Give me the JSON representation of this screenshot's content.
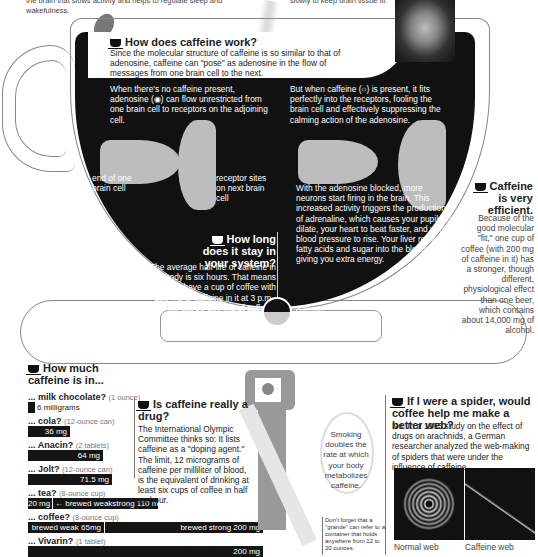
{
  "top_fragments": {
    "left": "the brain that slows activity and helps to regulate sleep and wakefulness.",
    "right": "slowly to keep brain tissue fit"
  },
  "how_works": {
    "title": "How does caffeine work?",
    "intro": "Since the molecular structure of caffeine is so similar to that of adenosine, caffeine can \"pose\" as adenosine in the flow of messages from one brain cell to the next.",
    "left_text": "When there's no caffeine present, adenosine (◉) can flow unrestricted from one brain cell to receptors on the adjoining cell.",
    "right_text": "But when caffeine (○) is present, it fits perfectly into the receptors, fooling the brain cell and effectively suppressing the calming action of the adenosine.",
    "label_end_cell": "end of one brain cell",
    "label_receptor": "receptor sites on next brain cell",
    "blocked_text": "With the adenosine blocked, more neurons start firing in the brain. This increased activity triggers the production of adrenaline, which causes your pupils to dilate, your heart to beat faster, and your blood pressure to rise. Your liver releases fatty acids and sugar into the bloodstream, giving you extra energy."
  },
  "stay": {
    "title": "How long does it stay in your system?",
    "text": "The average half-life of caffeine in your body is six hours. That means that if you have a cup of coffee with 200 mg of caffeine in it at 3 p.m., there will still be 100 mg of caffeine left in your body at 9 p.m.",
    "gauge_left": "100 mg",
    "gauge_right": "200 mg"
  },
  "efficient": {
    "title": "Caffeine is very efficient.",
    "text": "Because of the good molecular \"fit,\" one cup of coffee (with 200 mg of caffeine in it) has a stronger, though different, physiological effect than one beer, which contains about 14,000 mg of alcohol."
  },
  "how_much": {
    "title": "How much caffeine is in...",
    "items": [
      {
        "name": "... milk chocolate?",
        "unit": "(1 ounce)",
        "bar": "6 milligrams",
        "value": 6
      },
      {
        "name": "... cola?",
        "unit": "(12-ounce can)",
        "bar": "36 mg",
        "value": 36
      },
      {
        "name": "... Anacin?",
        "unit": "(2 tablets)",
        "bar": "64 mg",
        "value": 64
      },
      {
        "name": "... Jolt?",
        "unit": "(12-ounce can)",
        "bar": "71.5 mg",
        "value": 71.5
      },
      {
        "name": "... tea?",
        "unit": "(8-ounce cup)",
        "bar_weak": "20 mg",
        "bar_mid": "← brewed weak",
        "bar_strong": "strong 110 mg",
        "value_low": 20,
        "value_high": 110
      },
      {
        "name": "... coffee?",
        "unit": "(8-ounce cup)",
        "bar_weak": "brewed weak 65mg",
        "bar_strong": "brewed strong 200 mg",
        "value_low": 65,
        "value_high": 200
      },
      {
        "name": "... Vivarin?",
        "unit": "(1 tablet)",
        "bar": "200 mg",
        "value": 200
      }
    ]
  },
  "drug": {
    "title": "Is caffeine really a drug?",
    "text": "The International Olympic Committee thinks so: It lists caffeine as a \"doping agent.\" The limit, 12 micrograms of caffeine per milliliter of blood, is the equivalent of drinking at least six cups of coffee in half an hour."
  },
  "smoking": {
    "text": "Smoking doubles the rate at which your body metabolizes caffeine."
  },
  "grande": {
    "text": "Don't forget that a \"grande\" can refer to a container that holds anywhere from 12 to 20 ounces."
  },
  "spider": {
    "title": "If I were a spider, would coffee help me make a better web?",
    "text": "No. In a 1965 study on the effect of drugs on arachnids, a German researcher analyzed the web-making of spiders that were under the influence of caffeine.",
    "caption_normal": "Normal web",
    "caption_caffeine": "Caffeine web"
  },
  "colors": {
    "cup": "#111111",
    "bar": "#151515",
    "synapse": "#bdbdbd",
    "outline": "#888888"
  }
}
